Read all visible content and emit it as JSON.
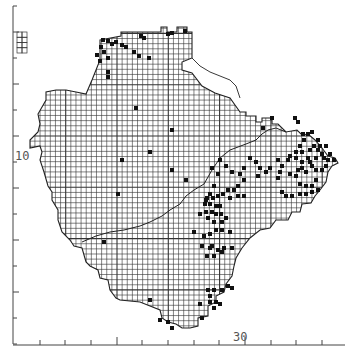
{
  "map": {
    "type": "distribution-grid-map",
    "background": "#ffffff",
    "ink_color": "#222222",
    "grid_color": "#333333",
    "dot_color": "#111111",
    "axis_color": "#444444",
    "cell_px": 5.13
  },
  "axes": {
    "y": {
      "x": 13,
      "top": 6,
      "bottom": 344,
      "ticks_y": [
        6,
        32,
        58,
        84,
        110,
        136,
        162,
        188,
        214,
        240,
        266,
        292,
        318,
        344
      ],
      "major_ticks_y": [
        32,
        84,
        136,
        188,
        240,
        292
      ],
      "label": "10",
      "label_pos": {
        "x": 15,
        "y": 160
      }
    },
    "x": {
      "y": 345,
      "left": 13,
      "right": 345,
      "ticks_x": [
        40,
        65,
        91,
        117,
        142,
        168,
        194,
        219,
        245,
        271,
        296,
        322
      ],
      "major_ticks_x": [
        117,
        245
      ],
      "label": "30",
      "label_pos": {
        "x": 233,
        "y": 341
      }
    }
  },
  "outline": [
    [
      100,
      40
    ],
    [
      121,
      36
    ],
    [
      121,
      32
    ],
    [
      161,
      32
    ],
    [
      161,
      27
    ],
    [
      167,
      27
    ],
    [
      167,
      32
    ],
    [
      177,
      32
    ],
    [
      177,
      27
    ],
    [
      187,
      27
    ],
    [
      187,
      32
    ],
    [
      192,
      32
    ],
    [
      192,
      58
    ],
    [
      182,
      62
    ],
    [
      182,
      70
    ],
    [
      192,
      73
    ],
    [
      202,
      86
    ],
    [
      215,
      93
    ],
    [
      230,
      98
    ],
    [
      240,
      112
    ],
    [
      246,
      112
    ],
    [
      246,
      116
    ],
    [
      256,
      116
    ],
    [
      256,
      122
    ],
    [
      262,
      122
    ],
    [
      262,
      118
    ],
    [
      272,
      118
    ],
    [
      272,
      124
    ],
    [
      278,
      124
    ],
    [
      286,
      132
    ],
    [
      297,
      130
    ],
    [
      302,
      135
    ],
    [
      308,
      134
    ],
    [
      315,
      140
    ],
    [
      322,
      148
    ],
    [
      328,
      156
    ],
    [
      335,
      158
    ],
    [
      338,
      163
    ],
    [
      332,
      166
    ],
    [
      328,
      172
    ],
    [
      326,
      182
    ],
    [
      320,
      190
    ],
    [
      315,
      196
    ],
    [
      311,
      203
    ],
    [
      302,
      204
    ],
    [
      300,
      212
    ],
    [
      292,
      212
    ],
    [
      288,
      220
    ],
    [
      276,
      220
    ],
    [
      270,
      228
    ],
    [
      260,
      230
    ],
    [
      250,
      238
    ],
    [
      242,
      248
    ],
    [
      236,
      258
    ],
    [
      234,
      266
    ],
    [
      232,
      276
    ],
    [
      226,
      284
    ],
    [
      224,
      292
    ],
    [
      216,
      296
    ],
    [
      216,
      302
    ],
    [
      208,
      306
    ],
    [
      208,
      316
    ],
    [
      198,
      318
    ],
    [
      198,
      326
    ],
    [
      190,
      328
    ],
    [
      182,
      328
    ],
    [
      176,
      324
    ],
    [
      168,
      322
    ],
    [
      162,
      318
    ],
    [
      160,
      310
    ],
    [
      150,
      306
    ],
    [
      140,
      302
    ],
    [
      120,
      300
    ],
    [
      116,
      298
    ],
    [
      110,
      290
    ],
    [
      108,
      280
    ],
    [
      100,
      278
    ],
    [
      98,
      270
    ],
    [
      90,
      266
    ],
    [
      86,
      262
    ],
    [
      82,
      248
    ],
    [
      74,
      246
    ],
    [
      70,
      240
    ],
    [
      62,
      232
    ],
    [
      58,
      220
    ],
    [
      58,
      210
    ],
    [
      52,
      200
    ],
    [
      52,
      192
    ],
    [
      48,
      186
    ],
    [
      44,
      172
    ],
    [
      40,
      160
    ],
    [
      42,
      152
    ],
    [
      40,
      146
    ],
    [
      30,
      148
    ],
    [
      30,
      140
    ],
    [
      38,
      132
    ],
    [
      40,
      124
    ],
    [
      38,
      114
    ],
    [
      46,
      100
    ],
    [
      46,
      92
    ],
    [
      56,
      90
    ],
    [
      62,
      90
    ],
    [
      66,
      90
    ],
    [
      76,
      92
    ],
    [
      86,
      94
    ],
    [
      92,
      80
    ],
    [
      96,
      70
    ],
    [
      100,
      60
    ],
    [
      100,
      40
    ]
  ],
  "inset": {
    "x": 17,
    "y": 32,
    "w": 10,
    "h": 21
  },
  "coastline_inner": [
    [
      82,
      242
    ],
    [
      96,
      236
    ],
    [
      110,
      232
    ],
    [
      124,
      230
    ],
    [
      140,
      226
    ],
    [
      150,
      222
    ],
    [
      162,
      216
    ],
    [
      170,
      210
    ],
    [
      180,
      204
    ],
    [
      186,
      196
    ],
    [
      194,
      190
    ],
    [
      204,
      184
    ],
    [
      212,
      170
    ],
    [
      220,
      158
    ],
    [
      230,
      150
    ],
    [
      246,
      144
    ],
    [
      256,
      140
    ],
    [
      262,
      134
    ],
    [
      268,
      130
    ],
    [
      276,
      128
    ],
    [
      286,
      132
    ]
  ],
  "river_line": [
    [
      192,
      58
    ],
    [
      200,
      66
    ],
    [
      210,
      72
    ],
    [
      220,
      76
    ],
    [
      230,
      80
    ],
    [
      236,
      86
    ],
    [
      240,
      98
    ]
  ],
  "dots": [
    [
      103,
      40
    ],
    [
      108,
      41
    ],
    [
      112,
      44
    ],
    [
      116,
      42
    ],
    [
      122,
      45
    ],
    [
      126,
      47
    ],
    [
      101,
      47
    ],
    [
      104,
      52
    ],
    [
      97,
      55
    ],
    [
      100,
      61
    ],
    [
      108,
      58
    ],
    [
      108,
      72
    ],
    [
      108,
      77
    ],
    [
      141,
      36
    ],
    [
      144,
      38
    ],
    [
      134,
      52
    ],
    [
      139,
      56
    ],
    [
      149,
      58
    ],
    [
      168,
      34
    ],
    [
      172,
      33
    ],
    [
      185,
      31
    ],
    [
      263,
      128
    ],
    [
      272,
      118
    ],
    [
      295,
      118
    ],
    [
      298,
      122
    ],
    [
      303,
      134
    ],
    [
      308,
      134
    ],
    [
      312,
      132
    ],
    [
      318,
      140
    ],
    [
      304,
      140
    ],
    [
      300,
      146
    ],
    [
      310,
      150
    ],
    [
      318,
      150
    ],
    [
      322,
      154
    ],
    [
      324,
      158
    ],
    [
      316,
      158
    ],
    [
      310,
      162
    ],
    [
      302,
      162
    ],
    [
      296,
      158
    ],
    [
      290,
      156
    ],
    [
      296,
      152
    ],
    [
      302,
      152
    ],
    [
      308,
      158
    ],
    [
      312,
      166
    ],
    [
      316,
      170
    ],
    [
      322,
      170
    ],
    [
      326,
      166
    ],
    [
      328,
      160
    ],
    [
      334,
      160
    ],
    [
      330,
      154
    ],
    [
      326,
      146
    ],
    [
      320,
      146
    ],
    [
      314,
      146
    ],
    [
      306,
      172
    ],
    [
      302,
      168
    ],
    [
      298,
      170
    ],
    [
      290,
      174
    ],
    [
      288,
      160
    ],
    [
      282,
      166
    ],
    [
      280,
      172
    ],
    [
      278,
      178
    ],
    [
      296,
      176
    ],
    [
      300,
      184
    ],
    [
      306,
      186
    ],
    [
      312,
      186
    ],
    [
      316,
      180
    ],
    [
      318,
      190
    ],
    [
      312,
      192
    ],
    [
      306,
      194
    ],
    [
      300,
      194
    ],
    [
      292,
      196
    ],
    [
      286,
      196
    ],
    [
      282,
      192
    ],
    [
      250,
      158
    ],
    [
      256,
      162
    ],
    [
      260,
      168
    ],
    [
      258,
      176
    ],
    [
      266,
      172
    ],
    [
      270,
      168
    ],
    [
      278,
      160
    ],
    [
      244,
      168
    ],
    [
      240,
      174
    ],
    [
      232,
      172
    ],
    [
      226,
      166
    ],
    [
      220,
      160
    ],
    [
      218,
      174
    ],
    [
      244,
      180
    ],
    [
      238,
      186
    ],
    [
      228,
      190
    ],
    [
      212,
      168
    ],
    [
      214,
      186
    ],
    [
      210,
      194
    ],
    [
      206,
      200
    ],
    [
      207,
      198
    ],
    [
      213,
      198
    ],
    [
      218,
      196
    ],
    [
      223,
      194
    ],
    [
      205,
      204
    ],
    [
      210,
      204
    ],
    [
      216,
      206
    ],
    [
      220,
      206
    ],
    [
      206,
      212
    ],
    [
      212,
      212
    ],
    [
      216,
      214
    ],
    [
      221,
      214
    ],
    [
      200,
      214
    ],
    [
      208,
      218
    ],
    [
      214,
      222
    ],
    [
      222,
      222
    ],
    [
      226,
      218
    ],
    [
      222,
      230
    ],
    [
      194,
      232
    ],
    [
      204,
      236
    ],
    [
      210,
      234
    ],
    [
      216,
      230
    ],
    [
      202,
      246
    ],
    [
      210,
      248
    ],
    [
      218,
      250
    ],
    [
      222,
      252
    ],
    [
      214,
      256
    ],
    [
      207,
      256
    ],
    [
      224,
      248
    ],
    [
      232,
      248
    ],
    [
      230,
      232
    ],
    [
      212,
      246
    ],
    [
      234,
      190
    ],
    [
      238,
      196
    ],
    [
      244,
      196
    ],
    [
      230,
      198
    ],
    [
      150,
      152
    ],
    [
      136,
      108
    ],
    [
      122,
      160
    ],
    [
      118,
      194
    ],
    [
      104,
      242
    ],
    [
      186,
      180
    ],
    [
      172,
      170
    ],
    [
      172,
      130
    ],
    [
      150,
      300
    ],
    [
      168,
      322
    ],
    [
      172,
      328
    ],
    [
      160,
      320
    ],
    [
      208,
      290
    ],
    [
      210,
      296
    ],
    [
      216,
      302
    ],
    [
      210,
      302
    ],
    [
      214,
      308
    ],
    [
      202,
      318
    ],
    [
      200,
      304
    ],
    [
      214,
      290
    ],
    [
      222,
      290
    ],
    [
      232,
      288
    ],
    [
      228,
      286
    ],
    [
      220,
      304
    ]
  ]
}
